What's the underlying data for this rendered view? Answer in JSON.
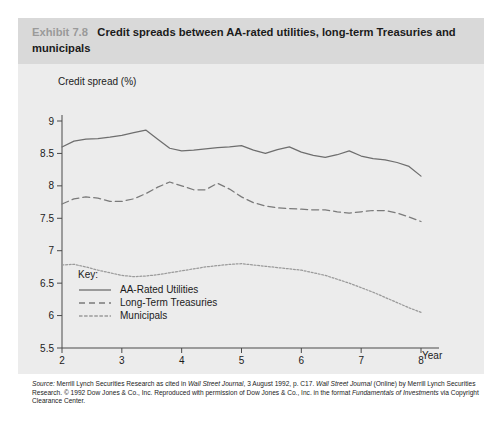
{
  "exhibit": {
    "number": "Exhibit 7.8",
    "title": "Credit spreads between AA-rated utilities, long-term Treasuries and municipals"
  },
  "key": {
    "heading": "Key:",
    "entries": [
      {
        "label": "AA-Rated Utilities",
        "style": "solid"
      },
      {
        "label": "Long-Term Treasuries",
        "style": "dashed"
      },
      {
        "label": "Municipals",
        "style": "dotted"
      }
    ]
  },
  "source": {
    "line": "Source: Merrill Lynch Securities Research as cited in Wall Street Journal, 3 August 1992, p. C17. Wall Street Journal (Online) by Merrill Lynch Securities Research. © 1992 Dow Jones & Co., Inc. Reproduced with permission of Dow Jones & Co., Inc. in the format Fundamentals of Investments via Copyright Clearance Center.",
    "prefix_italic": "Source:",
    "italic_1": "Wall Street Journal",
    "italic_2": "Wall Street Journal",
    "italic_3": "Fundamentals of Investments"
  },
  "colors": {
    "title_band": "#d9d9d9",
    "plot_background": "#ececec",
    "exhibit_number": "#9a9a9a",
    "axis": "#4a4a4a",
    "utilities": "#6e6e6e",
    "treasuries": "#7a7a7a",
    "municipals": "#9a9a9a"
  },
  "chart_data": {
    "type": "line",
    "title": "Credit spreads between AA-rated utilities, long-term Treasuries and municipals",
    "xlabel": "Year",
    "ylabel": "Credit spread (%)",
    "xlim": [
      2,
      8
    ],
    "ylim": [
      5.5,
      9
    ],
    "xticks": [
      2,
      3,
      4,
      5,
      6,
      7,
      8
    ],
    "yticks": [
      5.5,
      6,
      6.5,
      7,
      7.5,
      8,
      8.5,
      9
    ],
    "grid": false,
    "legend_position": "inside-lower-left",
    "x": [
      2.0,
      2.2,
      2.4,
      2.6,
      2.8,
      3.0,
      3.2,
      3.4,
      3.6,
      3.8,
      4.0,
      4.2,
      4.4,
      4.6,
      4.8,
      5.0,
      5.2,
      5.4,
      5.6,
      5.8,
      6.0,
      6.2,
      6.4,
      6.6,
      6.8,
      7.0,
      7.2,
      7.4,
      7.6,
      7.8,
      8.0
    ],
    "series": [
      {
        "name": "AA-Rated Utilities",
        "style": "solid",
        "values": [
          8.6,
          8.69,
          8.72,
          8.73,
          8.75,
          8.78,
          8.82,
          8.86,
          8.72,
          8.58,
          8.54,
          8.55,
          8.57,
          8.59,
          8.6,
          8.62,
          8.55,
          8.5,
          8.56,
          8.6,
          8.52,
          8.47,
          8.44,
          8.48,
          8.54,
          8.46,
          8.42,
          8.4,
          8.36,
          8.3,
          8.15
        ]
      },
      {
        "name": "Long-Term Treasuries",
        "style": "dashed",
        "values": [
          7.72,
          7.8,
          7.83,
          7.81,
          7.76,
          7.76,
          7.8,
          7.88,
          7.98,
          8.06,
          8.0,
          7.94,
          7.94,
          8.04,
          7.95,
          7.83,
          7.74,
          7.69,
          7.66,
          7.65,
          7.64,
          7.63,
          7.63,
          7.6,
          7.58,
          7.6,
          7.62,
          7.62,
          7.58,
          7.52,
          7.45
        ]
      },
      {
        "name": "Municipals",
        "style": "dotted",
        "values": [
          6.78,
          6.79,
          6.75,
          6.7,
          6.66,
          6.62,
          6.6,
          6.61,
          6.63,
          6.66,
          6.69,
          6.72,
          6.75,
          6.77,
          6.79,
          6.8,
          6.78,
          6.76,
          6.74,
          6.72,
          6.7,
          6.66,
          6.62,
          6.56,
          6.5,
          6.43,
          6.36,
          6.28,
          6.2,
          6.12,
          6.05
        ]
      }
    ]
  }
}
